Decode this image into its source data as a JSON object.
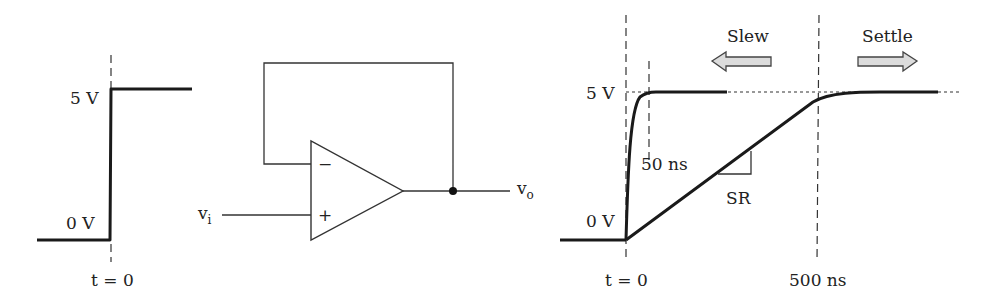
{
  "input_step": {
    "high_label": "5 V",
    "low_label": "0 V",
    "time_label": "t = 0"
  },
  "opamp_circuit": {
    "input_label": "v",
    "input_sub": "i",
    "output_label": "v",
    "output_sub": "o",
    "inverting_symbol": "−",
    "noninverting_symbol": "+",
    "configuration": "voltage follower (unity-gain buffer)"
  },
  "output_response": {
    "high_label": "5 V",
    "low_label": "0 V",
    "t0_label": "t = 0",
    "fast_time_label": "50 ns",
    "slow_time_label": "500 ns",
    "slope_label": "SR",
    "slew_label": "Slew",
    "settle_label": "Settle"
  }
}
